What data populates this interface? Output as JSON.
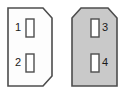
{
  "diagram": {
    "background_color": "#ffffff",
    "outline_color": "#4d4d4d",
    "connectors": [
      {
        "id": "left-connector",
        "name": "left-connector",
        "fill_color": "#fdfdfd",
        "outline_color": "#4d4d4d",
        "shape": "chamfered-right-corners",
        "outline_path": "M 8 8 L 43 8 L 52 18 L 52 76 L 43 86 L 8 86 Z",
        "pins": [
          {
            "number": "1",
            "label_x": 21,
            "label_y": 28,
            "label_side": "left-of-slot",
            "slot_x": 26,
            "slot_y": 19,
            "slot_w": 8,
            "slot_h": 18,
            "slot_fill": "#ffffff",
            "slot_outline": "#4d4d4d"
          },
          {
            "number": "2",
            "label_x": 21,
            "label_y": 63,
            "label_side": "left-of-slot",
            "slot_x": 26,
            "slot_y": 54,
            "slot_w": 8,
            "slot_h": 18,
            "slot_fill": "#ffffff",
            "slot_outline": "#4d4d4d"
          }
        ]
      },
      {
        "id": "right-connector",
        "name": "right-connector",
        "fill_color": "#c9c9c9",
        "outline_color": "#4d4d4d",
        "shape": "chamfered-top-corners",
        "outline_path": "M 72 18 L 81 8 L 108 8 L 117 18 L 117 86 L 72 86 Z",
        "pins": [
          {
            "number": "3",
            "label_x": 102,
            "label_y": 28,
            "label_side": "right-of-slot",
            "slot_x": 91,
            "slot_y": 19,
            "slot_w": 8,
            "slot_h": 18,
            "slot_fill": "#ffffff",
            "slot_outline": "#4d4d4d"
          },
          {
            "number": "4",
            "label_x": 102,
            "label_y": 63,
            "label_side": "right-of-slot",
            "slot_x": 91,
            "slot_y": 54,
            "slot_w": 8,
            "slot_h": 18,
            "slot_fill": "#ffffff",
            "slot_outline": "#4d4d4d"
          }
        ]
      }
    ]
  }
}
